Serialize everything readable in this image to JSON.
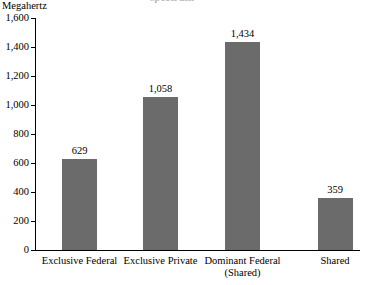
{
  "chart_data": {
    "type": "bar",
    "title": "",
    "clipped_title_fragment": "spectrum",
    "ylabel": "Megahertz",
    "xlabel": "",
    "categories": [
      "Exclusive Federal",
      "Exclusive Private",
      "Dominant Federal (Shared)",
      "Shared"
    ],
    "category_lines": [
      [
        "Exclusive Federal"
      ],
      [
        "Exclusive Private"
      ],
      [
        "Dominant Federal",
        "(Shared)"
      ],
      [
        "Shared"
      ]
    ],
    "values": [
      629,
      1058,
      1434,
      359
    ],
    "value_labels": [
      "629",
      "1,058",
      "1,434",
      "359"
    ],
    "ylim": [
      0,
      1600
    ],
    "ytick_values": [
      0,
      200,
      400,
      600,
      800,
      1000,
      1200,
      1400,
      1600
    ],
    "ytick_labels": [
      "0",
      "200",
      "400",
      "600",
      "800",
      "1,000",
      "1,200",
      "1,400",
      "1,600"
    ],
    "grid": false,
    "legend": false,
    "bar_color": "#6b6b6b",
    "axis_color": "#000000",
    "background_color": "#ffffff"
  }
}
